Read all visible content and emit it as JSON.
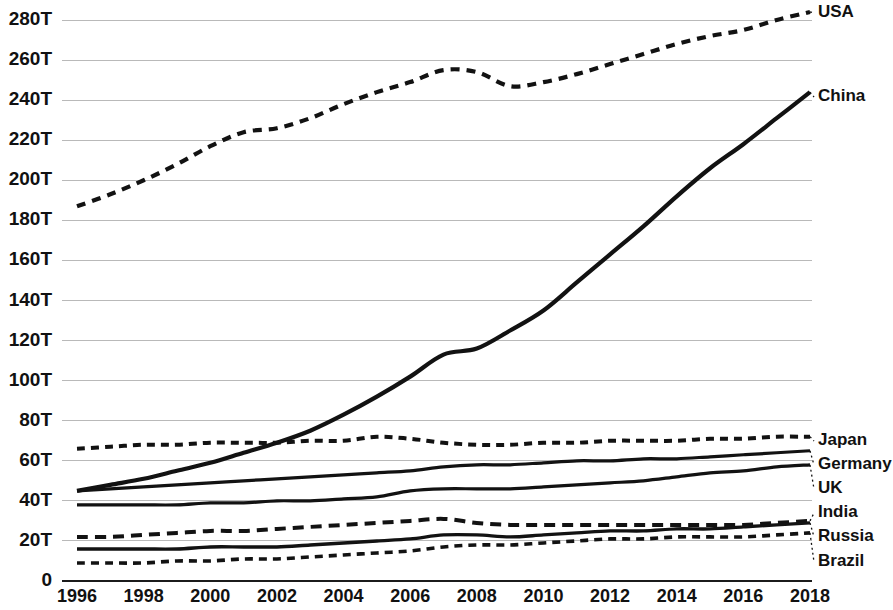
{
  "chart_data": {
    "type": "line",
    "title": "",
    "subtitle": "",
    "xlabel": "",
    "ylabel": "",
    "xlim": [
      1996,
      2018
    ],
    "ylim": [
      0,
      290
    ],
    "grid": true,
    "legend_position": "right-inline-labels",
    "x": [
      1996,
      1997,
      1998,
      1999,
      2000,
      2001,
      2002,
      2003,
      2004,
      2005,
      2006,
      2007,
      2008,
      2009,
      2010,
      2011,
      2012,
      2013,
      2014,
      2015,
      2016,
      2017,
      2018
    ],
    "xticks": [
      "1996",
      "1998",
      "2000",
      "2002",
      "2004",
      "2006",
      "2008",
      "2010",
      "2012",
      "2014",
      "2016",
      "2018"
    ],
    "xtick_values": [
      1996,
      1998,
      2000,
      2002,
      2004,
      2006,
      2008,
      2010,
      2012,
      2014,
      2016,
      2018
    ],
    "yticks": [
      "0",
      "20T",
      "40T",
      "60T",
      "80T",
      "100T",
      "120T",
      "140T",
      "160T",
      "180T",
      "200T",
      "220T",
      "240T",
      "260T",
      "280T"
    ],
    "ytick_values": [
      0,
      20,
      40,
      60,
      80,
      100,
      120,
      140,
      160,
      180,
      200,
      220,
      240,
      260,
      280
    ],
    "unit_suffix": "T",
    "series": [
      {
        "name": "USA",
        "style": "dashed",
        "dash": "9,7",
        "width": 4.2,
        "color": "#121212",
        "label_y": 13,
        "values": [
          187,
          193,
          200,
          208,
          217,
          224,
          226,
          231,
          238,
          244,
          249,
          255,
          254,
          247,
          249,
          253,
          258,
          263,
          268,
          272,
          275,
          280,
          284
        ]
      },
      {
        "name": "China",
        "style": "solid",
        "dash": "none",
        "width": 4.2,
        "color": "#121212",
        "label_y": 97,
        "values": [
          45,
          48,
          51,
          55,
          59,
          64,
          69,
          75,
          83,
          92,
          102,
          113,
          116,
          125,
          135,
          149,
          163,
          177,
          192,
          206,
          218,
          231,
          244
        ]
      },
      {
        "name": "Japan",
        "style": "dashed",
        "dash": "8,6",
        "width": 4.0,
        "color": "#121212",
        "label_y": 441,
        "values": [
          66,
          67,
          68,
          68,
          69,
          69,
          69,
          70,
          70,
          72,
          71,
          69,
          68,
          68,
          69,
          69,
          70,
          70,
          70,
          71,
          71,
          72,
          72
        ]
      },
      {
        "name": "Germany",
        "style": "solid",
        "dash": "none",
        "width": 3.2,
        "color": "#121212",
        "label_y": 465,
        "values": [
          45,
          46,
          47,
          48,
          49,
          50,
          51,
          52,
          53,
          54,
          55,
          57,
          58,
          58,
          59,
          60,
          60,
          61,
          61,
          62,
          63,
          64,
          65
        ]
      },
      {
        "name": "UK",
        "style": "solid",
        "dash": "none",
        "width": 3.2,
        "color": "#121212",
        "label_y": 489,
        "values": [
          38,
          38,
          38,
          38,
          39,
          39,
          40,
          40,
          41,
          42,
          45,
          46,
          46,
          46,
          47,
          48,
          49,
          50,
          52,
          54,
          55,
          57,
          58
        ]
      },
      {
        "name": "India",
        "style": "dashed",
        "dash": "11,7",
        "width": 4.0,
        "color": "#121212",
        "label_y": 513,
        "values": [
          22,
          22,
          23,
          24,
          25,
          25,
          26,
          27,
          28,
          29,
          30,
          31,
          29,
          28,
          28,
          28,
          28,
          28,
          28,
          28,
          28,
          29,
          30
        ]
      },
      {
        "name": "Russia",
        "style": "solid",
        "dash": "none",
        "width": 3.4,
        "color": "#121212",
        "label_y": 537,
        "values": [
          16,
          16,
          16,
          16,
          17,
          17,
          17,
          18,
          19,
          20,
          21,
          23,
          23,
          22,
          23,
          24,
          25,
          25,
          26,
          26,
          27,
          28,
          29
        ]
      },
      {
        "name": "Brazil",
        "style": "dashed",
        "dash": "8,6",
        "width": 3.6,
        "color": "#121212",
        "label_y": 562,
        "values": [
          9,
          9,
          9,
          10,
          10,
          11,
          11,
          12,
          13,
          14,
          15,
          17,
          18,
          18,
          19,
          20,
          21,
          21,
          22,
          22,
          22,
          23,
          24
        ]
      }
    ]
  },
  "axis": {
    "y_axis_name": "value-axis",
    "x_axis_name": "year-axis"
  }
}
